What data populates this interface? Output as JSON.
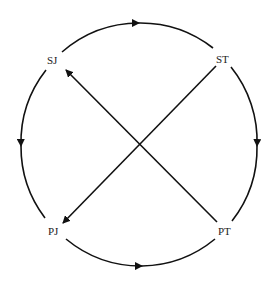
{
  "diagram": {
    "type": "cycle-with-crossing-arrows",
    "nodes": [
      {
        "id": "SJ",
        "label": "SJ",
        "position": "top-left"
      },
      {
        "id": "ST",
        "label": "ST",
        "position": "top-right"
      },
      {
        "id": "PT",
        "label": "PT",
        "position": "bottom-right"
      },
      {
        "id": "PJ",
        "label": "PJ",
        "position": "bottom-left"
      }
    ],
    "edges": [
      {
        "from": "SJ",
        "to": "ST",
        "style": "arc",
        "side": "top"
      },
      {
        "from": "ST",
        "to": "PT",
        "style": "arc",
        "side": "right"
      },
      {
        "from": "PJ",
        "to": "PT",
        "style": "arc",
        "side": "bottom"
      },
      {
        "from": "SJ",
        "to": "PJ",
        "style": "arc",
        "side": "left"
      },
      {
        "from": "PT",
        "to": "SJ",
        "style": "straight",
        "side": "diagonal"
      },
      {
        "from": "ST",
        "to": "PJ",
        "style": "straight",
        "side": "diagonal"
      }
    ],
    "stroke_color": "#111111",
    "background": "#ffffff"
  }
}
